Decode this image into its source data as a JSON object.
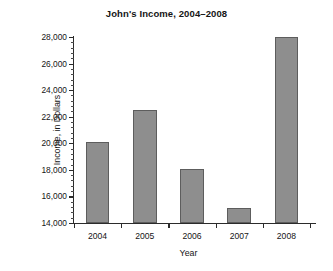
{
  "chart_data": {
    "type": "bar",
    "title": "John's Income, 2004–2008",
    "xlabel": "Year",
    "ylabel": "Income, in Dollars",
    "categories": [
      "2004",
      "2005",
      "2006",
      "2007",
      "2008"
    ],
    "values": [
      20100,
      22500,
      18100,
      15100,
      28000
    ],
    "ylim": [
      14000,
      28000
    ],
    "ytick_labels": [
      "14,000",
      "16,000",
      "18,000",
      "20,000",
      "22,000",
      "24,000",
      "26,000",
      "28,000"
    ],
    "ytick_values": [
      14000,
      16000,
      18000,
      20000,
      22000,
      24000,
      26000,
      28000
    ],
    "y_minor_step": 400,
    "grid": false,
    "legend": null,
    "bar_color": "#8e8e8e",
    "bar_edge_color": "#5d5d5d",
    "axis_color": "#2b2b2b"
  }
}
